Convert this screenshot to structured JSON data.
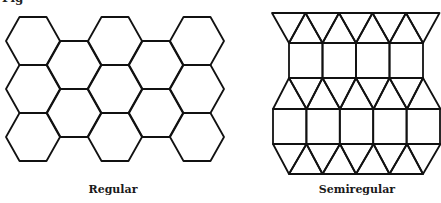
{
  "figure": {
    "top_fragment": "Fig",
    "stroke_color": "#111111",
    "background": "#ffffff",
    "panels": [
      {
        "id": "regular",
        "caption": "Regular",
        "caption_center_x": 113,
        "tiling": "hexagonal",
        "hex": {
          "side": 27,
          "origin_x": 6,
          "origin_y": 17,
          "row_height": 48,
          "col_step": 41,
          "columns": [
            {
              "rows": 3,
              "y_offset": 0
            },
            {
              "rows": 2,
              "y_offset": 24
            },
            {
              "rows": 3,
              "y_offset": 0
            },
            {
              "rows": 2,
              "y_offset": 24
            },
            {
              "rows": 3,
              "y_offset": 0
            }
          ]
        }
      },
      {
        "id": "semiregular",
        "caption": "Semiregular",
        "caption_center_x": 357,
        "tiling": "triangles-and-squares",
        "rows": [
          {
            "type": "triangles-down",
            "y_top": 13,
            "y_bottom": 43,
            "x_start": 272,
            "x_end": 440,
            "count": 5,
            "apex_start": 289
          },
          {
            "type": "squares",
            "y_top": 43,
            "y_bottom": 78,
            "x_start": 289,
            "x_end": 423,
            "count": 4
          },
          {
            "type": "triangles-up",
            "y_top": 78,
            "y_bottom": 109,
            "x_start": 273,
            "x_end": 440,
            "count": 5,
            "apex_start": 289
          },
          {
            "type": "squares",
            "y_top": 109,
            "y_bottom": 144,
            "x_start": 273,
            "x_end": 440,
            "count": 5
          },
          {
            "type": "triangles-down",
            "y_top": 144,
            "y_bottom": 174,
            "x_start": 273,
            "x_end": 440,
            "count": 5,
            "apex_start": 289
          }
        ]
      }
    ]
  }
}
